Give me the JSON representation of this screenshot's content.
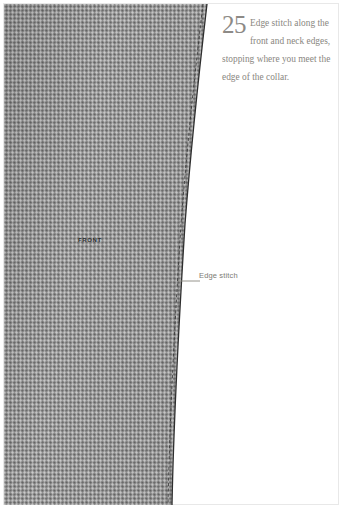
{
  "illustration": {
    "kind": "sewing-pattern-diagram",
    "fabric": {
      "piece_label": "FRONT",
      "fabric_color": "#9a9a9a",
      "edge_line_color": "#2e2e2e",
      "stitch_line_color": "#3a3a3a"
    },
    "callout": {
      "label": "Edge stitch",
      "label_color": "#7d7a74",
      "leader_line_color": "#8b8880"
    }
  },
  "instruction": {
    "step_number": "25",
    "step_number_color": "#8d8a86",
    "text": "Edge stitch along the front and neck edges, stopping where you meet the edge of the collar.",
    "text_color": "#8a877f"
  },
  "page": {
    "background": "#ffffff",
    "border_color": "#e8e8e8",
    "width": 343,
    "height": 509
  }
}
